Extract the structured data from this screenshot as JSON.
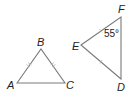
{
  "diagram": {
    "colors": {
      "stroke": "#7a7a7a",
      "text": "#222222",
      "ticks": "#bdbdbd"
    },
    "triangle1": {
      "vertices": {
        "A": "A",
        "B": "B",
        "C": "C"
      },
      "congruent_sides": [
        "AB",
        "BC"
      ],
      "tick_style": "double"
    },
    "triangle2": {
      "vertices": {
        "D": "D",
        "E": "E",
        "F": "F"
      },
      "congruent_sides": [
        "EF",
        "ED"
      ],
      "tick_style": "single",
      "angle_label": "55°",
      "angle_at": "F"
    }
  }
}
